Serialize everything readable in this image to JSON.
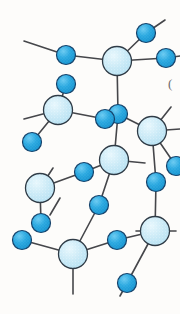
{
  "figure": {
    "title": "Amorphous silica network ball-and-stick model",
    "description": "Two-dimensional schematic of a continuous random network of corner-sharing tetrahedra, large pale-blue atoms bonded to small bright-blue atoms",
    "background_color": "#fdfcfa",
    "width": 180,
    "height": 314
  },
  "style": {
    "large_atom_fill": "#c8e9f6",
    "large_atom_fill_light": "#ddf3fb",
    "large_atom_stroke": "#2f3b46",
    "large_atom_radius": 14.5,
    "small_atom_fill": "#22a3dd",
    "small_atom_fill_light": "#5cc3ef",
    "small_atom_stroke": "#17436b",
    "small_atom_radius": 9.5,
    "bond_color": "#45464a",
    "bond_width": 1.6,
    "speckle_color": "#ffffff"
  },
  "legend": {
    "large_atom_label": "silicon",
    "small_atom_label": "oxygen"
  },
  "atoms": [
    {
      "id": "S1",
      "name": "silicon-atom-1",
      "kind": "large",
      "cx": 117,
      "cy": 61
    },
    {
      "id": "S2",
      "name": "silicon-atom-2",
      "kind": "large",
      "cx": 58,
      "cy": 110
    },
    {
      "id": "S3",
      "name": "silicon-atom-3",
      "kind": "large",
      "cx": 152,
      "cy": 131
    },
    {
      "id": "S4",
      "name": "silicon-atom-4",
      "kind": "large",
      "cx": 114,
      "cy": 160
    },
    {
      "id": "S5",
      "name": "silicon-atom-5",
      "kind": "large",
      "cx": 40,
      "cy": 188
    },
    {
      "id": "S6",
      "name": "silicon-atom-6",
      "kind": "large",
      "cx": 155,
      "cy": 231
    },
    {
      "id": "S7",
      "name": "silicon-atom-7",
      "kind": "large",
      "cx": 73,
      "cy": 254
    },
    {
      "id": "O1",
      "name": "oxygen-atom-1",
      "kind": "small",
      "cx": 66,
      "cy": 55
    },
    {
      "id": "O2",
      "name": "oxygen-atom-2",
      "kind": "small",
      "cx": 146,
      "cy": 33
    },
    {
      "id": "O3",
      "name": "oxygen-atom-3",
      "kind": "small",
      "cx": 166,
      "cy": 58
    },
    {
      "id": "O4",
      "name": "oxygen-atom-4",
      "kind": "small",
      "cx": 66,
      "cy": 84
    },
    {
      "id": "O5",
      "name": "oxygen-atom-5",
      "kind": "small",
      "cx": 118,
      "cy": 114
    },
    {
      "id": "O6",
      "name": "oxygen-atom-6",
      "kind": "small",
      "cx": 105,
      "cy": 119
    },
    {
      "id": "O7",
      "name": "oxygen-atom-7",
      "kind": "small",
      "cx": 32,
      "cy": 142
    },
    {
      "id": "O8",
      "name": "oxygen-atom-8",
      "kind": "small",
      "cx": 84,
      "cy": 172
    },
    {
      "id": "O9",
      "name": "oxygen-atom-9",
      "kind": "small",
      "cx": 156,
      "cy": 182
    },
    {
      "id": "O10",
      "name": "oxygen-atom-10",
      "kind": "small",
      "cx": 176,
      "cy": 166
    },
    {
      "id": "O11",
      "name": "oxygen-atom-11",
      "kind": "small",
      "cx": 99,
      "cy": 205
    },
    {
      "id": "O12",
      "name": "oxygen-atom-12",
      "kind": "small",
      "cx": 41,
      "cy": 223
    },
    {
      "id": "O13",
      "name": "oxygen-atom-13",
      "kind": "small",
      "cx": 22,
      "cy": 240
    },
    {
      "id": "O14",
      "name": "oxygen-atom-14",
      "kind": "small",
      "cx": 117,
      "cy": 240
    },
    {
      "id": "O15",
      "name": "oxygen-atom-15",
      "kind": "small",
      "cx": 127,
      "cy": 283
    }
  ],
  "bonds": [
    {
      "name": "bond-S1-O1",
      "x1": 117,
      "y1": 61,
      "x2": 66,
      "y2": 55
    },
    {
      "name": "bond-S1-O2",
      "x1": 117,
      "y1": 61,
      "x2": 146,
      "y2": 33
    },
    {
      "name": "bond-S1-O3",
      "x1": 117,
      "y1": 61,
      "x2": 166,
      "y2": 58
    },
    {
      "name": "bond-S1-O5",
      "x1": 117,
      "y1": 61,
      "x2": 118,
      "y2": 114
    },
    {
      "name": "bond-S2-O4",
      "x1": 58,
      "y1": 110,
      "x2": 66,
      "y2": 84
    },
    {
      "name": "bond-S2-O7",
      "x1": 58,
      "y1": 110,
      "x2": 32,
      "y2": 142
    },
    {
      "name": "bond-S2-O6",
      "x1": 58,
      "y1": 110,
      "x2": 105,
      "y2": 119
    },
    {
      "name": "bond-O5-S4",
      "x1": 118,
      "y1": 114,
      "x2": 114,
      "y2": 160
    },
    {
      "name": "bond-O5-S3",
      "x1": 118,
      "y1": 114,
      "x2": 152,
      "y2": 131
    },
    {
      "name": "bond-S3-O10",
      "x1": 152,
      "y1": 131,
      "x2": 176,
      "y2": 166
    },
    {
      "name": "bond-S3-O9",
      "x1": 152,
      "y1": 131,
      "x2": 156,
      "y2": 182
    },
    {
      "name": "bond-S4-O8",
      "x1": 114,
      "y1": 160,
      "x2": 84,
      "y2": 172
    },
    {
      "name": "bond-S4-O11",
      "x1": 114,
      "y1": 160,
      "x2": 99,
      "y2": 205
    },
    {
      "name": "bond-O8-S5",
      "x1": 84,
      "y1": 172,
      "x2": 40,
      "y2": 188
    },
    {
      "name": "bond-S5-O12",
      "x1": 40,
      "y1": 188,
      "x2": 41,
      "y2": 223
    },
    {
      "name": "bond-O11-S7",
      "x1": 99,
      "y1": 205,
      "x2": 73,
      "y2": 254
    },
    {
      "name": "bond-S7-O13",
      "x1": 73,
      "y1": 254,
      "x2": 22,
      "y2": 240
    },
    {
      "name": "bond-S7-O14",
      "x1": 73,
      "y1": 254,
      "x2": 117,
      "y2": 240
    },
    {
      "name": "bond-O14-S6",
      "x1": 117,
      "y1": 240,
      "x2": 155,
      "y2": 231
    },
    {
      "name": "bond-O9-S6",
      "x1": 156,
      "y1": 182,
      "x2": 155,
      "y2": 231
    },
    {
      "name": "bond-S6-O15",
      "x1": 155,
      "y1": 231,
      "x2": 127,
      "y2": 283
    }
  ],
  "open_bonds": [
    {
      "name": "open-bond-upper-left",
      "x1": 66,
      "y1": 55,
      "x2": 24,
      "y2": 41
    },
    {
      "name": "open-bond-upper-right",
      "x1": 146,
      "y1": 33,
      "x2": 165,
      "y2": 20
    },
    {
      "name": "open-bond-right-top",
      "x1": 166,
      "y1": 58,
      "x2": 180,
      "y2": 56
    },
    {
      "name": "open-bond-left-mid",
      "x1": 58,
      "y1": 110,
      "x2": 24,
      "y2": 119
    },
    {
      "name": "open-bond-right-mid",
      "x1": 152,
      "y1": 131,
      "x2": 171,
      "y2": 107
    },
    {
      "name": "open-bond-right-far",
      "x1": 152,
      "y1": 131,
      "x2": 180,
      "y2": 129
    },
    {
      "name": "open-bond-center-cross",
      "x1": 114,
      "y1": 160,
      "x2": 145,
      "y2": 163
    },
    {
      "name": "open-bond-s5-up",
      "x1": 40,
      "y1": 188,
      "x2": 53,
      "y2": 168
    },
    {
      "name": "open-bond-s6-right",
      "x1": 155,
      "y1": 231,
      "x2": 176,
      "y2": 231
    },
    {
      "name": "open-bond-s6-left",
      "x1": 155,
      "y1": 231,
      "x2": 136,
      "y2": 231
    },
    {
      "name": "open-bond-s7-down",
      "x1": 73,
      "y1": 254,
      "x2": 73,
      "y2": 294
    },
    {
      "name": "open-bond-o15-down",
      "x1": 127,
      "y1": 283,
      "x2": 120,
      "y2": 296
    },
    {
      "name": "open-bond-o10-right",
      "x1": 176,
      "y1": 166,
      "x2": 180,
      "y2": 166
    },
    {
      "name": "open-bond-lower-left",
      "x1": 60,
      "y1": 198,
      "x2": 50,
      "y2": 215
    }
  ],
  "artifacts": [
    {
      "name": "scan-artifact-parenthesis",
      "x": 168,
      "y": 88,
      "text": "("
    }
  ]
}
